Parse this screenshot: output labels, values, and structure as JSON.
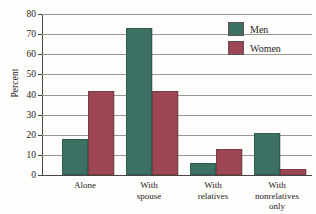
{
  "chart_data": {
    "type": "bar",
    "title": "",
    "xlabel": "",
    "ylabel": "Percent",
    "ylim": [
      0,
      80
    ],
    "ytick_step": 10,
    "yticks": [
      80,
      70,
      60,
      50,
      40,
      30,
      20,
      10,
      0
    ],
    "grid": true,
    "legend_position": "top-right",
    "categories": [
      "Alone",
      "With spouse",
      "With relatives",
      "With nonrelatives only"
    ],
    "category_lines": [
      [
        "Alone"
      ],
      [
        "With",
        "spouse"
      ],
      [
        "With",
        "relatives"
      ],
      [
        "With",
        "nonrelatives",
        "only"
      ]
    ],
    "series": [
      {
        "name": "Men",
        "color": "#3d7163",
        "values": [
          17,
          72,
          5,
          20
        ]
      },
      {
        "name": "Women",
        "color": "#9c4753",
        "values": [
          41,
          41,
          12,
          2
        ]
      }
    ]
  },
  "legend": {
    "items": [
      {
        "label": "Men",
        "color": "#3d7163"
      },
      {
        "label": "Women",
        "color": "#9c4753"
      }
    ]
  },
  "axes": {
    "y_title": "Percent"
  }
}
